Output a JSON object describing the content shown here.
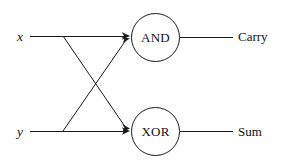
{
  "diagram": {
    "type": "logic-circuit",
    "stroke_color": "#1a1a1a",
    "background_color": "#ffffff",
    "inputs": [
      {
        "name": "x",
        "label": "x",
        "y": 36
      },
      {
        "name": "y",
        "label": "y",
        "y": 131
      }
    ],
    "gates": [
      {
        "name": "and-gate",
        "label": "AND",
        "shape": "circle",
        "cx": 156,
        "cy": 37,
        "r": 24
      },
      {
        "name": "xor-gate",
        "label": "XOR",
        "shape": "circle",
        "cx": 156,
        "cy": 131,
        "r": 24
      }
    ],
    "outputs": [
      {
        "name": "carry",
        "label": "Carry",
        "from_gate": "AND",
        "y": 37
      },
      {
        "name": "sum",
        "label": "Sum",
        "from_gate": "XOR",
        "y": 131
      }
    ],
    "wires": [
      {
        "name": "x-to-and",
        "from": "x",
        "to": "AND",
        "path": "M30,36 L128,36"
      },
      {
        "name": "y-to-xor",
        "from": "y",
        "to": "XOR",
        "path": "M30,131 L128,131"
      },
      {
        "name": "x-to-xor",
        "from": "x",
        "to": "XOR",
        "path": "M63,36 L127,129"
      },
      {
        "name": "y-to-and",
        "from": "y",
        "to": "AND",
        "path": "M63,131 L127,39"
      },
      {
        "name": "and-to-carry",
        "from": "AND",
        "to": "Carry",
        "path": "M180,37 L233,37"
      },
      {
        "name": "xor-to-sum",
        "from": "XOR",
        "to": "Sum",
        "path": "M180,131 L233,131"
      }
    ],
    "arrowheads": [
      {
        "name": "and-input-arrow-upper",
        "x": 128,
        "y": 36
      },
      {
        "name": "and-input-arrow-lower",
        "x": 127,
        "y": 39
      },
      {
        "name": "xor-input-arrow-upper",
        "x": 127,
        "y": 129
      },
      {
        "name": "xor-input-arrow-lower",
        "x": 128,
        "y": 131
      }
    ]
  }
}
